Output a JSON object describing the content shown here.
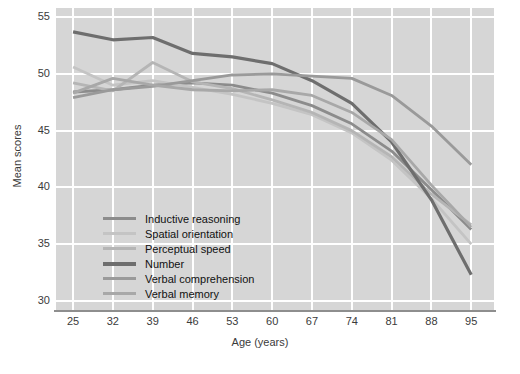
{
  "chart_data": {
    "type": "line",
    "title": "",
    "xlabel": "Age (years)",
    "ylabel": "Mean scores",
    "x": [
      25,
      32,
      39,
      46,
      53,
      60,
      67,
      74,
      81,
      88,
      95
    ],
    "xtick_labels": [
      "25",
      "32",
      "39",
      "46",
      "53",
      "60",
      "67",
      "74",
      "81",
      "88",
      "95"
    ],
    "ytick_labels": [
      "55",
      "50",
      "45",
      "40",
      "35",
      "30"
    ],
    "yticks": [
      55,
      50,
      45,
      40,
      35,
      30
    ],
    "ylim": [
      29.2,
      55.8
    ],
    "xlim": [
      22.0,
      99.0
    ],
    "grid": true,
    "legend_position": "inside-lower-left",
    "plot_background": "#d6d6d6",
    "grid_color": "#ffffff",
    "axis_color": "#8e8e8e",
    "series": [
      {
        "name": "Inductive reasoning",
        "color": "#8c8c8c",
        "values": [
          48.4,
          48.6,
          49.0,
          49.2,
          49.0,
          48.3,
          47.2,
          45.6,
          43.2,
          39.8,
          36.3
        ]
      },
      {
        "name": "Spatial orientation",
        "color": "#c4c4c4",
        "values": [
          50.6,
          49.0,
          49.4,
          48.8,
          48.2,
          47.4,
          46.4,
          44.8,
          42.4,
          39.0,
          35.0
        ]
      },
      {
        "name": "Perceptual speed",
        "color": "#b5b5b5",
        "values": [
          49.2,
          48.5,
          51.0,
          49.3,
          48.7,
          47.7,
          46.6,
          45.0,
          42.7,
          39.4,
          36.7
        ]
      },
      {
        "name": "Number",
        "color": "#6e6e6e",
        "values": [
          53.7,
          53.0,
          53.2,
          51.8,
          51.5,
          50.9,
          49.4,
          47.4,
          44.0,
          38.9,
          32.3
        ]
      },
      {
        "name": "Verbal comprehension",
        "color": "#9a9a9a",
        "values": [
          47.9,
          48.6,
          48.9,
          49.4,
          49.9,
          50.0,
          49.8,
          49.6,
          48.1,
          45.4,
          42.0
        ]
      },
      {
        "name": "Verbal memory",
        "color": "#a8a8a8",
        "values": [
          48.3,
          49.6,
          49.0,
          48.6,
          48.5,
          48.6,
          48.1,
          46.6,
          44.2,
          40.2,
          36.5
        ]
      }
    ]
  }
}
